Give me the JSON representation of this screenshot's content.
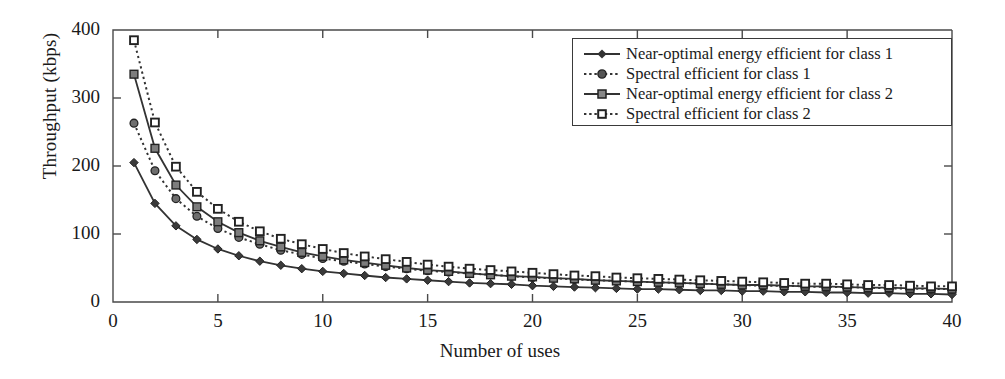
{
  "chart_data": {
    "type": "line",
    "title": "",
    "xlabel": "Number of uses",
    "ylabel": "Throughput (kbps)",
    "xlim": [
      0,
      40
    ],
    "ylim": [
      0,
      400
    ],
    "xticks": [
      0,
      5,
      10,
      15,
      20,
      25,
      30,
      35,
      40
    ],
    "yticks": [
      0,
      100,
      200,
      300,
      400
    ],
    "grid": false,
    "legend_position": "top-right",
    "x": [
      1,
      2,
      3,
      4,
      5,
      6,
      7,
      8,
      9,
      10,
      11,
      12,
      13,
      14,
      15,
      16,
      17,
      18,
      19,
      20,
      21,
      22,
      23,
      24,
      25,
      26,
      27,
      28,
      29,
      30,
      31,
      32,
      33,
      34,
      35,
      36,
      37,
      38,
      39,
      40
    ],
    "series": [
      {
        "name": "Near-optimal energy efficient for class 1",
        "line_style": "solid",
        "marker": "diamond",
        "color": "#333333",
        "values": [
          205,
          145,
          112,
          92,
          78,
          68,
          60,
          54,
          49,
          45,
          42,
          39,
          36,
          34,
          32,
          30,
          28,
          27,
          26,
          24,
          23,
          22,
          21,
          20,
          19,
          19,
          18,
          17,
          17,
          16,
          16,
          15,
          15,
          14,
          14,
          13,
          13,
          12,
          12,
          11
        ]
      },
      {
        "name": "Spectral efficient for class 1",
        "line_style": "dotted",
        "marker": "circle",
        "color": "#333333",
        "values": [
          263,
          193,
          152,
          126,
          108,
          95,
          85,
          76,
          70,
          64,
          60,
          56,
          52,
          49,
          46,
          44,
          42,
          40,
          38,
          36,
          35,
          33,
          32,
          31,
          30,
          29,
          28,
          27,
          26,
          25,
          24,
          24,
          23,
          22,
          22,
          21,
          20,
          20,
          19,
          19
        ]
      },
      {
        "name": "Near-optimal energy efficient for class 2",
        "line_style": "solid",
        "marker": "square",
        "color": "#333333",
        "values": [
          335,
          226,
          172,
          140,
          118,
          102,
          90,
          81,
          73,
          67,
          62,
          58,
          54,
          50,
          47,
          45,
          42,
          40,
          38,
          37,
          35,
          34,
          32,
          31,
          30,
          29,
          28,
          27,
          26,
          25,
          25,
          24,
          23,
          23,
          22,
          21,
          21,
          20,
          20,
          19
        ]
      },
      {
        "name": "Spectral efficient for class 2",
        "line_style": "dotted",
        "marker": "open-square",
        "color": "#333333",
        "values": [
          385,
          264,
          199,
          162,
          137,
          118,
          104,
          93,
          85,
          78,
          72,
          67,
          63,
          59,
          55,
          52,
          49,
          47,
          45,
          43,
          41,
          39,
          38,
          36,
          35,
          34,
          33,
          32,
          31,
          30,
          29,
          28,
          27,
          27,
          26,
          25,
          25,
          24,
          23,
          23
        ]
      }
    ]
  },
  "axes": {
    "ytick_labels": [
      "0",
      "100",
      "200",
      "300",
      "400"
    ],
    "xtick_labels": [
      "0",
      "5",
      "10",
      "15",
      "20",
      "25",
      "30",
      "35",
      "40"
    ],
    "ylabel": "Throughput (kbps)",
    "xlabel": "Number of uses"
  },
  "legend": {
    "items": [
      {
        "label": "Near-optimal energy efficient for class 1",
        "marker": "diamond",
        "style": "solid"
      },
      {
        "label": "Spectral efficient for class 1",
        "marker": "circle",
        "style": "dotted"
      },
      {
        "label": "Near-optimal energy efficient for class 2",
        "marker": "square",
        "style": "solid"
      },
      {
        "label": "Spectral efficient for class 2",
        "marker": "open-square",
        "style": "dotted"
      }
    ]
  }
}
